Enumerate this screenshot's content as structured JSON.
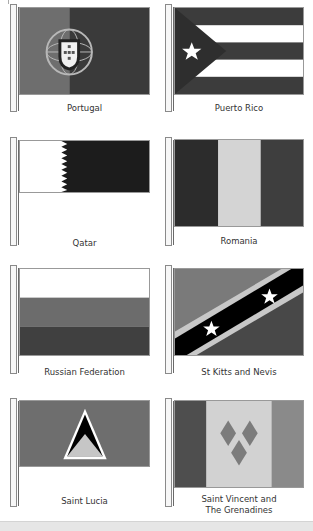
{
  "flags": [
    {
      "name": "Portugal",
      "colors": {
        "left": "#6e6e6e",
        "right": "#3a3a3a",
        "emblem": "#b8b8b8"
      }
    },
    {
      "name": "Puerto Rico",
      "colors": {
        "stripe_dark": "#3c3c3c",
        "stripe_light": "#ffffff",
        "triangle": "#2e2e2e",
        "star": "#ffffff"
      }
    },
    {
      "name": "Qatar",
      "colors": {
        "hoist": "#ffffff",
        "fly": "#1c1c1c"
      }
    },
    {
      "name": "Romania",
      "colors": {
        "left": "#2c2c2c",
        "middle": "#d4d4d4",
        "right": "#3e3e3e"
      }
    },
    {
      "name": "Russian Federation",
      "colors": {
        "top": "#ffffff",
        "middle": "#6c6c6c",
        "bottom": "#404040"
      }
    },
    {
      "name": "St Kitts and Nevis",
      "colors": {
        "upper": "#7a7a7a",
        "lower": "#484848",
        "band": "#000000",
        "fimbriation": "#c8c8c8",
        "star": "#ffffff"
      }
    },
    {
      "name": "Saint Lucia",
      "colors": {
        "field": "#6e6e6e",
        "outline": "#ffffff",
        "black_triangle": "#000000",
        "lower_triangle": "#c6c6c6"
      }
    },
    {
      "name": "Saint Vincent and The Grenadines",
      "label_lines": [
        "Saint Vincent and",
        "The Grenadines"
      ],
      "colors": {
        "left": "#4e4e4e",
        "middle": "#d2d2d2",
        "right": "#8a8a8a",
        "diamonds": "#7c7c7c"
      }
    }
  ]
}
